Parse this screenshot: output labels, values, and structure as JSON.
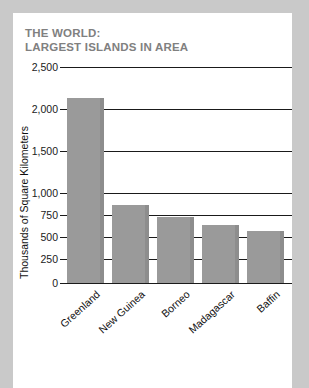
{
  "card": {
    "background_color": "#ffffff",
    "page_background_color": "#c9c9c9"
  },
  "title": {
    "line1": "THE WORLD:",
    "line2": "LARGEST ISLANDS IN AREA",
    "color": "#808080"
  },
  "chart_data": {
    "type": "bar",
    "title": "THE WORLD: LARGEST ISLANDS IN AREA",
    "subtitle": "",
    "xlabel": "",
    "ylabel": "Thousands of Square Kilometers",
    "categories": [
      "Greenland",
      "New Guinea",
      "Borneo",
      "Madagascar",
      "Baffin"
    ],
    "values": [
      2130,
      860,
      730,
      640,
      570
    ],
    "ylim": [
      0,
      2500
    ],
    "ytick_labels": [
      "2,500",
      "2,000",
      "1,500",
      "1,000",
      "750",
      "500",
      "250",
      "0"
    ],
    "ytick_values": [
      2500,
      2000,
      1500,
      1000,
      750,
      500,
      250,
      0
    ],
    "axis_note": "non-uniform y-axis: 500-unit steps above 1,000; 250-unit steps below 1,000",
    "grid": true,
    "legend": false,
    "legend_position": "none",
    "bar_color": "#9a9a9a",
    "bar_edge_color": "#8d8d8d",
    "gridline_color": "#1a1a1a",
    "xtick_label_rotation": -42
  }
}
